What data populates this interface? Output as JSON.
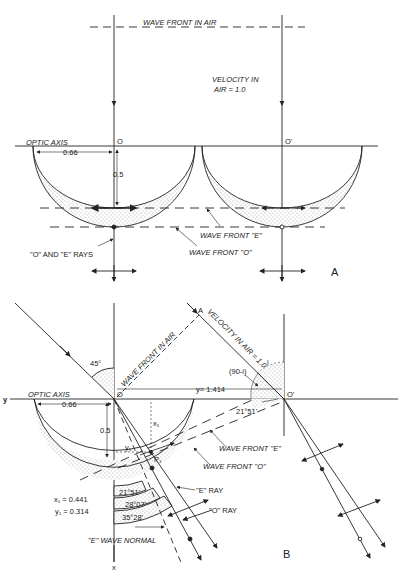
{
  "panel_a": {
    "label": "A",
    "wave_front_in_air": "WAVE FRONT IN AIR",
    "velocity_line1": "VELOCITY IN",
    "velocity_line2": "AIR = 1.0",
    "optic_axis": "OPTIC AXIS",
    "origin_o": "O",
    "origin_o_prime": "O'",
    "dim_horizontal": "0.66",
    "dim_vertical": "0.5",
    "wave_front_e": "WAVE FRONT \"E\"",
    "wave_front_o": "WAVE FRONT \"O\"",
    "rays_label": "\"O\" AND \"E\" RAYS"
  },
  "panel_b": {
    "label": "B",
    "point_a": "A",
    "wave_front_in_air": "WAVE FRONT IN AIR",
    "velocity_in_air": "VELOCITY IN AIR = 1.0",
    "angle_45": "45°",
    "angle_i": "i",
    "angle_90_minus_i": "(90-i)",
    "y_distance": "y= 1.414",
    "angle_2151_top": "21°51'",
    "y_axis": "y",
    "x_axis": "x",
    "optic_axis": "OPTIC AXIS",
    "origin_o": "O",
    "origin_o_prime": "O'",
    "dim_horizontal": "0.66",
    "dim_vertical": "0.5",
    "x1_label": "x₁",
    "y1_label": "y₁",
    "p1_label": "P₁",
    "angle_bands": [
      "21°51'",
      "28°07'",
      "35°28'"
    ],
    "wave_front_e": "WAVE FRONT \"E\"",
    "wave_front_o": "WAVE FRONT \"O\"",
    "e_ray": "\"E\" RAY",
    "o_ray": "\"O\" RAY",
    "e_wave_normal": "\"E\" WAVE NORMAL",
    "x1_value": "x₁ = 0.441",
    "y1_value": "y₁ = 0.314"
  }
}
